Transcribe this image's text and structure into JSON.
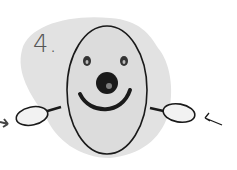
{
  "illustration": {
    "step_label": "4.",
    "subject": "smiling oval face with nose and hands",
    "colors": {
      "background": "#ffffff",
      "blob": "#e2e2e2",
      "face": "#dcdcdc",
      "stroke": "#1a1a1a",
      "hand_fill": "#f2f2f2"
    },
    "elements": [
      "shadow-blob",
      "oval-face",
      "eyes",
      "nose",
      "smile",
      "left-hand",
      "right-hand",
      "left-arrow",
      "right-arrow"
    ]
  }
}
